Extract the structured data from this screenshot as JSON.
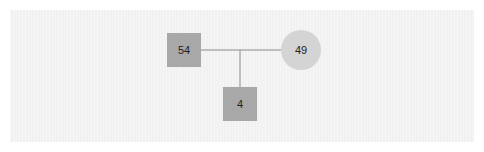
{
  "diagram": {
    "type": "pedigree",
    "colors": {
      "background": "#f1f1f1",
      "square_fill": "#a8a8a8",
      "circle_fill": "#d4d4d4",
      "line": "#8a8a8a",
      "text": "#222222"
    },
    "nodes": [
      {
        "id": "father",
        "shape": "square",
        "label": "54",
        "x": 167,
        "y": 33,
        "w": 34,
        "h": 34
      },
      {
        "id": "mother",
        "shape": "circle",
        "label": "49",
        "cx": 301,
        "cy": 50,
        "r": 20
      },
      {
        "id": "child",
        "shape": "square",
        "label": "4",
        "x": 223,
        "y": 87,
        "w": 34,
        "h": 34
      }
    ],
    "edges": [
      {
        "id": "marriage-line",
        "from": "father",
        "to": "mother"
      },
      {
        "id": "descent-line",
        "from": "marriage-line",
        "to": "child"
      }
    ]
  }
}
